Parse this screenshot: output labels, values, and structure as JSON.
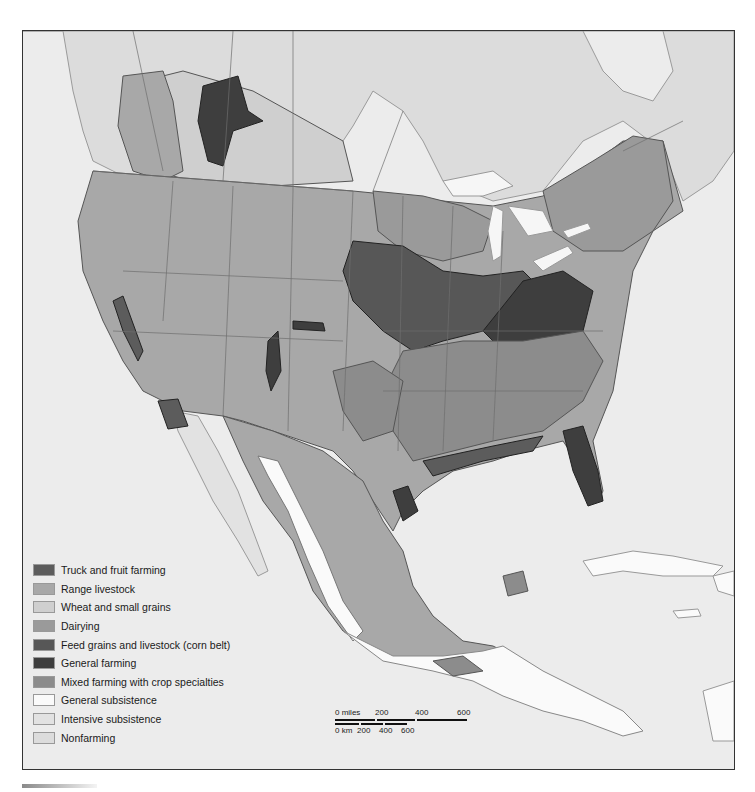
{
  "map": {
    "title": "Agricultural regions of North America",
    "background_color": "#ececec",
    "colors": {
      "water": "#ececec",
      "land_outline": "#9a9a9a",
      "state_border": "#6e6e6e"
    }
  },
  "legend": {
    "items": [
      {
        "label": "Truck and fruit farming",
        "color": "#5c5c5c"
      },
      {
        "label": "Range livestock",
        "color": "#a8a8a8"
      },
      {
        "label": "Wheat and small grains",
        "color": "#cfcfcf"
      },
      {
        "label": "Dairying",
        "color": "#9a9a9a"
      },
      {
        "label": "Feed grains and livestock (corn belt)",
        "color": "#575757"
      },
      {
        "label": "General farming",
        "color": "#3e3e3e"
      },
      {
        "label": "Mixed farming with crop specialties",
        "color": "#8c8c8c"
      },
      {
        "label": "General subsistence",
        "color": "#fafafa"
      },
      {
        "label": "Intensive subsistence",
        "color": "#e2e2e2"
      },
      {
        "label": "Nonfarming",
        "color": "#dcdcdc"
      }
    ]
  },
  "scale_bar": {
    "miles_label": "0 miles",
    "miles_ticks": [
      "200",
      "400",
      "600"
    ],
    "km_label": "0 km",
    "km_ticks": [
      "200",
      "400",
      "600"
    ]
  }
}
